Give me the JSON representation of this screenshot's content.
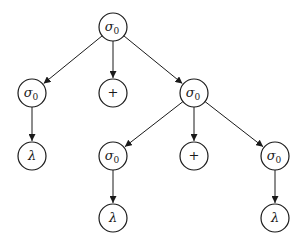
{
  "diagram": {
    "type": "tree",
    "nodes": [
      {
        "id": "n0",
        "label": "σ",
        "sub": "0",
        "x": 113,
        "y": 27
      },
      {
        "id": "n1",
        "label": "σ",
        "sub": "0",
        "x": 32,
        "y": 93
      },
      {
        "id": "n2",
        "label": "+",
        "sub": "",
        "x": 113,
        "y": 93
      },
      {
        "id": "n3",
        "label": "σ",
        "sub": "0",
        "x": 194,
        "y": 93
      },
      {
        "id": "n4",
        "label": "λ",
        "sub": "",
        "x": 32,
        "y": 156
      },
      {
        "id": "n5",
        "label": "σ",
        "sub": "0",
        "x": 113,
        "y": 156
      },
      {
        "id": "n6",
        "label": "+",
        "sub": "",
        "x": 194,
        "y": 156
      },
      {
        "id": "n7",
        "label": "σ",
        "sub": "0",
        "x": 275,
        "y": 156
      },
      {
        "id": "n8",
        "label": "λ",
        "sub": "",
        "x": 113,
        "y": 218
      },
      {
        "id": "n9",
        "label": "λ",
        "sub": "",
        "x": 275,
        "y": 218
      }
    ],
    "edges": [
      {
        "from": "n0",
        "to": "n1"
      },
      {
        "from": "n0",
        "to": "n2"
      },
      {
        "from": "n0",
        "to": "n3"
      },
      {
        "from": "n1",
        "to": "n4"
      },
      {
        "from": "n3",
        "to": "n5"
      },
      {
        "from": "n3",
        "to": "n6"
      },
      {
        "from": "n3",
        "to": "n7"
      },
      {
        "from": "n5",
        "to": "n8"
      },
      {
        "from": "n7",
        "to": "n9"
      }
    ],
    "node_radius": 14,
    "colors": {
      "stroke": "#1a1a1a",
      "fill": "#ffffff"
    }
  }
}
